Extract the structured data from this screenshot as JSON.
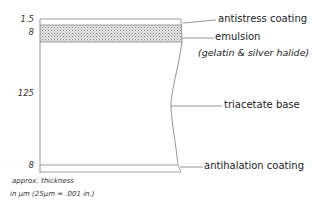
{
  "diagram": {
    "type": "film cross-section",
    "layers": [
      {
        "name": "antistress coating",
        "thickness": "1.5"
      },
      {
        "name": "emulsion",
        "sub_label": "(gelatin & silver halide)",
        "thickness": "8"
      },
      {
        "name": "triacetate base",
        "thickness": "125"
      },
      {
        "name": "antihalation coating",
        "thickness": "8"
      }
    ],
    "labels": {
      "antistress": "antistress coating",
      "emulsion": "emulsion",
      "emulsion_sub": "(gelatin & silver halide)",
      "base": "triacetate base",
      "antihalation": "antihalation coating"
    },
    "thickness": {
      "antistress": "1.5",
      "emulsion": "8",
      "base": "125",
      "antihalation": "8"
    },
    "note": {
      "line1": "approx. thickness",
      "line2": "in µm (25µm = .001 in.)"
    },
    "colors": {
      "line": "#777777",
      "stipple": "#bdbdbd"
    }
  }
}
